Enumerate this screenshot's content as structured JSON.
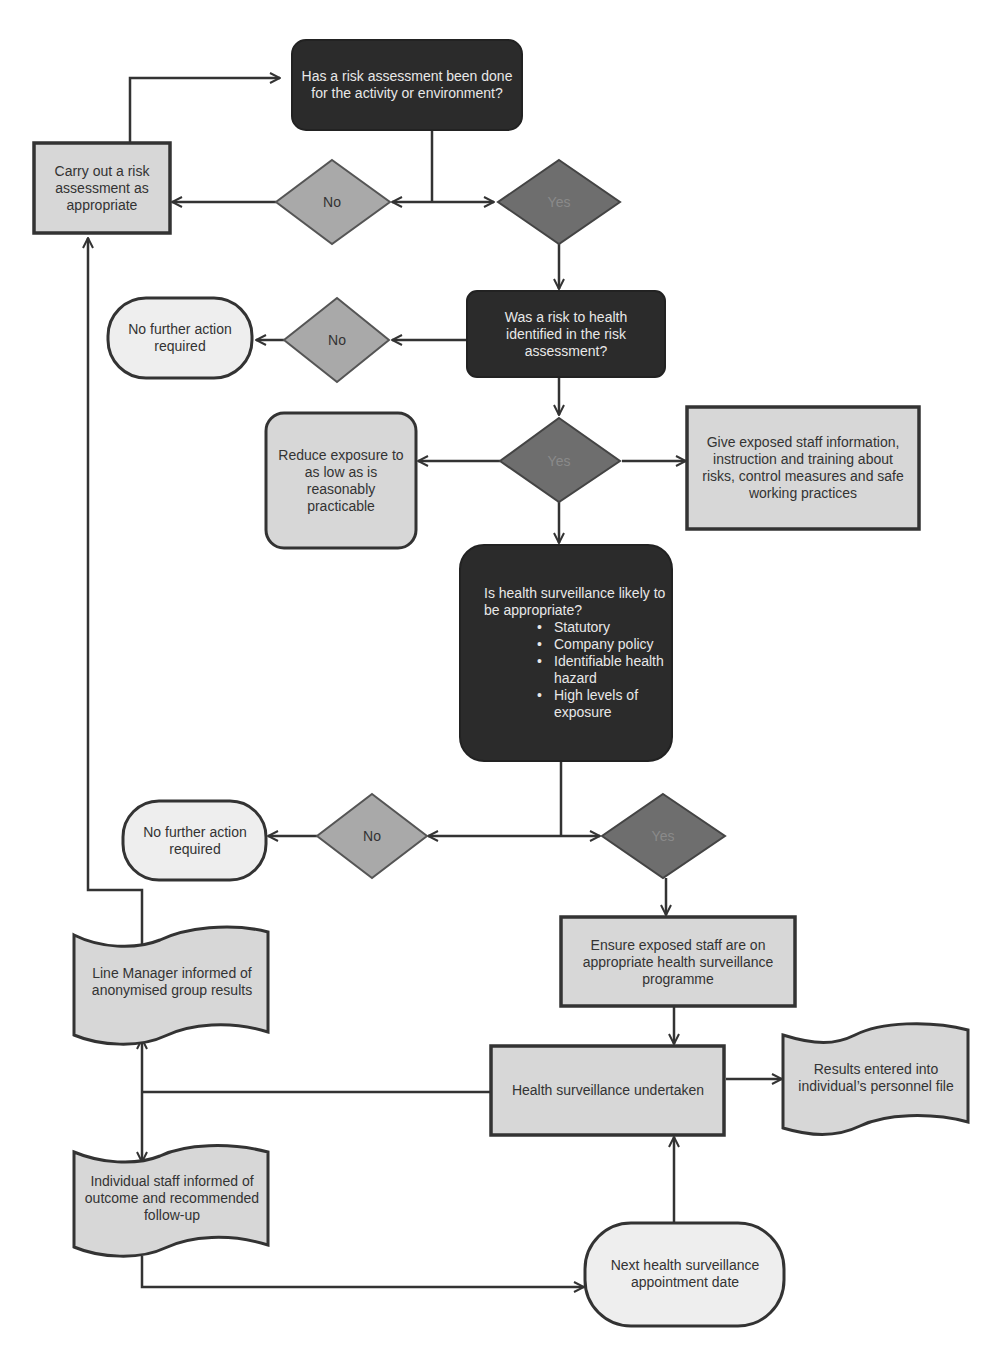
{
  "colors": {
    "dark_fill": "#2b2b2b",
    "yes_fill": "#6e6e6e",
    "no_fill": "#a9a9a9",
    "process_fill": "#d7d7d7",
    "terminal_fill": "#eeeeee",
    "stroke": "#333333"
  },
  "nodes": {
    "q1": "Has a risk assessment been done for the activity or environment?",
    "carry_out": "Carry out a risk assessment as appropriate",
    "d1_no": "No",
    "d1_yes": "Yes",
    "q2": "Was a risk to health identified in the risk assessment?",
    "d2_no": "No",
    "nfa1": "No further action required",
    "d2_yes": "Yes",
    "reduce": "Reduce exposure to as low as is reasonably practicable",
    "give_info": "Give exposed staff information, instruction and training about risks, control measures and safe working practices",
    "q3": {
      "title": "Is health surveillance likely to be appropriate?",
      "bullets": [
        "Statutory",
        "Company policy",
        "Identifiable health hazard",
        "High levels of exposure"
      ]
    },
    "d3_no": "No",
    "nfa2": "No further action required",
    "d3_yes": "Yes",
    "ensure": "Ensure exposed staff are on appropriate health surveillance programme",
    "hs_undertaken": "Health surveillance undertaken",
    "results_file": "Results entered into individual’s personnel file",
    "line_manager": "Line Manager informed of anonymised group results",
    "individual": "Individual staff informed of outcome and recommended follow-up",
    "next_date": "Next health surveillance appointment date"
  }
}
